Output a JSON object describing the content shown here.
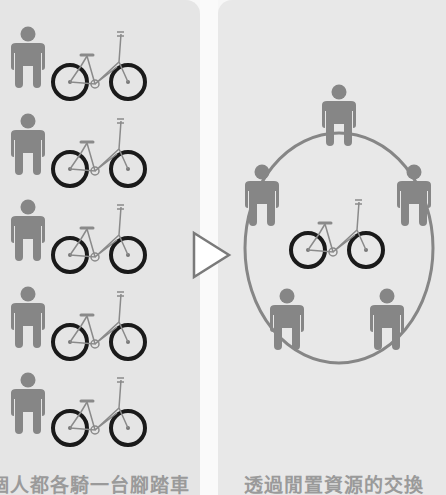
{
  "diagram": {
    "left": {
      "caption": "個人都各騎一台腳踏車",
      "rows": 5,
      "items": [
        {
          "person": "person-icon",
          "bike": "bicycle-icon"
        },
        {
          "person": "person-icon",
          "bike": "bicycle-icon"
        },
        {
          "person": "person-icon",
          "bike": "bicycle-icon"
        },
        {
          "person": "person-icon",
          "bike": "bicycle-icon"
        },
        {
          "person": "person-icon",
          "bike": "bicycle-icon"
        }
      ]
    },
    "arrow": "triangle-arrow-right-icon",
    "right": {
      "caption": "透過閒置資源的交換",
      "persons_around_circle": 5,
      "shared_bikes": 1
    },
    "colors": {
      "panel_bg": "#e5e5e5",
      "figure": "#868686",
      "wheel": "#1a1a1a",
      "frame": "#8a8a8a",
      "caption": "#9a9a9a",
      "arrow_fill": "#ffffff",
      "arrow_stroke": "#7a7a7a"
    }
  }
}
